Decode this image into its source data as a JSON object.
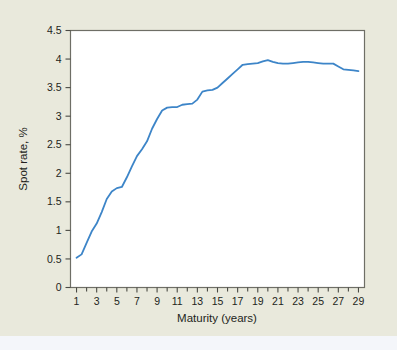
{
  "figure": {
    "background_color": "#e9e9dc",
    "plot_background_color": "#ffffff",
    "plot_border_color": "#6e6e66",
    "bottom_strip_color": "#f4f6fa"
  },
  "chart_data": {
    "type": "line",
    "title": "",
    "subtitle": "",
    "xlabel": "Maturity (years)",
    "ylabel": "Spot rate, %",
    "xlim": [
      0.4,
      29.6
    ],
    "ylim": [
      0,
      4.5
    ],
    "grid": false,
    "legend": null,
    "legend_position": "none",
    "line_color": "#3d85c8",
    "line_width": 1.8,
    "x_tick_labels": [
      "1",
      "3",
      "5",
      "7",
      "9",
      "11",
      "13",
      "15",
      "17",
      "19",
      "21",
      "23",
      "25",
      "27",
      "29"
    ],
    "x_tick_values": [
      1,
      3,
      5,
      7,
      9,
      11,
      13,
      15,
      17,
      19,
      21,
      23,
      25,
      27,
      29
    ],
    "x_minor_ticks": [
      2,
      4,
      6,
      8,
      10,
      12,
      14,
      16,
      18,
      20,
      22,
      24,
      26,
      28
    ],
    "y_tick_labels": [
      "0",
      "0.5",
      "1",
      "1.5",
      "2",
      "2.5",
      "3",
      "3.5",
      "4",
      "4.5"
    ],
    "y_tick_values": [
      0,
      0.5,
      1,
      1.5,
      2,
      2.5,
      3,
      3.5,
      4,
      4.5
    ],
    "x": [
      1,
      1.5,
      2,
      2.5,
      3,
      3.5,
      4,
      4.5,
      5,
      5.5,
      6,
      6.5,
      7,
      7.5,
      8,
      8.5,
      9,
      9.5,
      10,
      10.5,
      11,
      11.5,
      12,
      12.5,
      13,
      13.5,
      14,
      14.5,
      15,
      15.5,
      16,
      16.5,
      17,
      17.5,
      18,
      18.5,
      19,
      19.5,
      20,
      20.5,
      21,
      21.5,
      22,
      22.5,
      23,
      23.5,
      24,
      24.5,
      25,
      25.5,
      26,
      26.5,
      27,
      27.5,
      28,
      28.5,
      29
    ],
    "values": [
      0.52,
      0.58,
      0.78,
      0.98,
      1.12,
      1.32,
      1.55,
      1.68,
      1.74,
      1.76,
      1.93,
      2.12,
      2.3,
      2.42,
      2.56,
      2.78,
      2.95,
      3.1,
      3.15,
      3.16,
      3.16,
      3.2,
      3.21,
      3.22,
      3.29,
      3.43,
      3.45,
      3.46,
      3.5,
      3.58,
      3.66,
      3.74,
      3.82,
      3.9,
      3.91,
      3.92,
      3.93,
      3.96,
      3.98,
      3.95,
      3.93,
      3.92,
      3.92,
      3.93,
      3.94,
      3.95,
      3.95,
      3.94,
      3.93,
      3.92,
      3.92,
      3.92,
      3.87,
      3.82,
      3.81,
      3.8,
      3.79
    ]
  }
}
